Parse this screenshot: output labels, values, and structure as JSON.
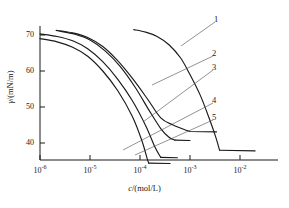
{
  "chart_data": {
    "type": "line",
    "title": "",
    "xlabel": "c/(mol/L)",
    "ylabel": "γ/(mN/m)",
    "xscale": "log",
    "xlim": [
      1e-06,
      0.02
    ],
    "ylim": [
      33,
      72
    ],
    "grid": false,
    "legend_position": "inline-right-leader-lines",
    "ytick_labels": [
      "70",
      "60",
      "50",
      "40"
    ],
    "ytick_values": [
      70,
      60,
      50,
      40
    ],
    "xtick_labels": [
      "10⁻⁶",
      "10⁻⁵",
      "10⁻⁴",
      "10⁻³",
      "10⁻²"
    ],
    "xtick_mantissa": "10",
    "xtick_exponents": [
      "-6",
      "-5",
      "-4",
      "-3",
      "-2"
    ],
    "xtick_values": [
      1e-06,
      1e-05,
      0.0001,
      0.001,
      0.01
    ],
    "series": [
      {
        "name": "1",
        "label": "1",
        "cmc": 0.0039,
        "gamma_plateau": 38.0,
        "gamma_start": 71.5,
        "x_start": 7.5e-05,
        "points": [
          [
            7.5e-05,
            71.5
          ],
          [
            0.00013,
            70.8
          ],
          [
            0.00022,
            69.6
          ],
          [
            0.00038,
            67.3
          ],
          [
            0.00065,
            63.6
          ],
          [
            0.001,
            59.0
          ],
          [
            0.0016,
            53.3
          ],
          [
            0.0024,
            47.0
          ],
          [
            0.0033,
            41.5
          ],
          [
            0.0039,
            38.0
          ],
          [
            0.02,
            37.8
          ]
        ]
      },
      {
        "name": "2",
        "label": "2",
        "cmc": 0.0009,
        "gamma_plateau": 43.3,
        "gamma_start": 71.3,
        "x_start": 2.1e-06,
        "points": [
          [
            2.1e-06,
            71.3
          ],
          [
            4.5e-06,
            70.6
          ],
          [
            9e-06,
            69.3
          ],
          [
            1.8e-05,
            66.8
          ],
          [
            3.5e-05,
            63.0
          ],
          [
            7e-05,
            58.0
          ],
          [
            0.00014,
            52.3
          ],
          [
            0.00026,
            47.0
          ],
          [
            0.00046,
            45.0
          ],
          [
            0.0009,
            43.4
          ],
          [
            0.001,
            43.2
          ],
          [
            0.0034,
            43.1
          ]
        ]
      },
      {
        "name": "3",
        "label": "3",
        "cmc": 0.0005,
        "gamma_plateau": 40.8,
        "gamma_start": 71.1,
        "x_start": 2.4e-06,
        "points": [
          [
            2.4e-06,
            71.1
          ],
          [
            5e-06,
            70.2
          ],
          [
            1e-05,
            68.6
          ],
          [
            2e-05,
            65.6
          ],
          [
            4e-05,
            61.3
          ],
          [
            8e-05,
            55.5
          ],
          [
            0.00015,
            49.2
          ],
          [
            0.00026,
            44.0
          ],
          [
            0.00038,
            41.6
          ],
          [
            0.0005,
            40.8
          ],
          [
            0.001,
            40.7
          ]
        ]
      },
      {
        "name": "4",
        "label": "4",
        "cmc": 0.00026,
        "gamma_plateau": 35.9,
        "gamma_start": 70.3,
        "x_start": 1e-06,
        "points": [
          [
            1e-06,
            70.3
          ],
          [
            2.2e-06,
            69.6
          ],
          [
            4.5e-06,
            68.4
          ],
          [
            9e-06,
            66.2
          ],
          [
            1.8e-05,
            62.6
          ],
          [
            3.6e-05,
            57.7
          ],
          [
            7e-05,
            51.8
          ],
          [
            0.00013,
            44.8
          ],
          [
            0.0002,
            38.8
          ],
          [
            0.00026,
            36.0
          ],
          [
            0.00056,
            35.9
          ]
        ]
      },
      {
        "name": "5",
        "label": "5",
        "cmc": 0.00015,
        "gamma_plateau": 34.3,
        "gamma_start": 69.0,
        "x_start": 1e-06,
        "points": [
          [
            1e-06,
            69.0
          ],
          [
            2.2e-06,
            68.1
          ],
          [
            4.5e-06,
            66.6
          ],
          [
            9e-06,
            64.1
          ],
          [
            1.8e-05,
            60.0
          ],
          [
            3.6e-05,
            54.5
          ],
          [
            7e-05,
            47.4
          ],
          [
            0.00011,
            40.5
          ],
          [
            0.00014,
            35.5
          ],
          [
            0.00015,
            34.4
          ],
          [
            0.0004,
            34.3
          ]
        ]
      }
    ],
    "annotations": [
      {
        "label": "1",
        "leader_from": [
          215,
          22
        ],
        "leader_to": [
          181,
          46
        ]
      },
      {
        "label": "2",
        "leader_from": [
          213,
          56
        ],
        "leader_to": [
          152,
          85
        ]
      },
      {
        "label": "3",
        "leader_from": [
          213,
          70
        ],
        "leader_to": [
          143,
          122
        ]
      },
      {
        "label": "4",
        "leader_from": [
          213,
          103
        ],
        "leader_to": [
          123,
          150
        ]
      },
      {
        "label": "5",
        "leader_from": [
          213,
          120
        ],
        "leader_to": [
          135,
          155
        ]
      }
    ]
  },
  "axes": {
    "y_title_symbol": "γ",
    "y_title_unit": "/(mN/m)",
    "x_title_symbol": "c",
    "x_title_unit": "/(mol/L)"
  }
}
